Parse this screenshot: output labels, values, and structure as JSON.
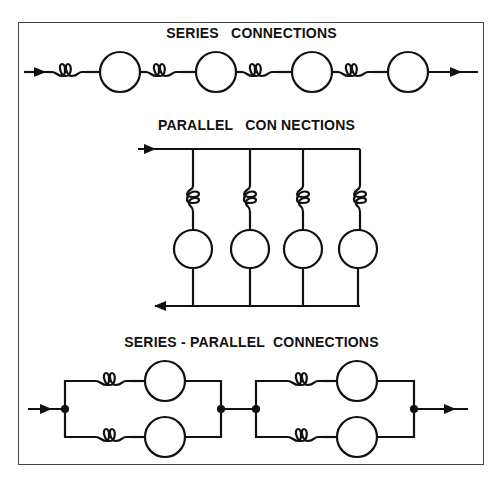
{
  "sections": {
    "series": {
      "title": "SERIES   CONNECTIONS",
      "motors": 4,
      "field_coils": 4
    },
    "parallel": {
      "title": "PARALLEL   CON NECTIONS",
      "branches": 4
    },
    "series_parallel": {
      "title": "SERIES - PARALLEL  CONNECTIONS",
      "groups": 2,
      "branches_per_group": 2
    }
  },
  "colors": {
    "line": "#111111",
    "border": "#444444",
    "background": "#ffffff"
  }
}
